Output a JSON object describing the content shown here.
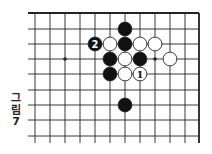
{
  "diagram": {
    "type": "go-board-partial",
    "caption": {
      "line1": "그",
      "line2": "림",
      "line3": "7"
    },
    "grid": {
      "columns_x": [
        35,
        50,
        65,
        80,
        95,
        110,
        125,
        140,
        155,
        170,
        185,
        199
      ],
      "rows_y": [
        13,
        29,
        44,
        59,
        74,
        90,
        105,
        120,
        136
      ],
      "left_open_x": 28,
      "bottom_open_y": 143,
      "edges": [
        "top",
        "right"
      ]
    },
    "star_points": [
      {
        "col": 2,
        "row": 3
      },
      {
        "col": 8,
        "row": 3
      }
    ],
    "stones": [
      {
        "col": 6,
        "row": 1,
        "color": "black",
        "label": ""
      },
      {
        "col": 4,
        "row": 2,
        "color": "black",
        "label": "2"
      },
      {
        "col": 5,
        "row": 2,
        "color": "white",
        "label": ""
      },
      {
        "col": 6,
        "row": 2,
        "color": "black",
        "label": ""
      },
      {
        "col": 7,
        "row": 2,
        "color": "white",
        "label": ""
      },
      {
        "col": 8,
        "row": 2,
        "color": "white",
        "label": ""
      },
      {
        "col": 5,
        "row": 3,
        "color": "black",
        "label": ""
      },
      {
        "col": 6,
        "row": 3,
        "color": "white",
        "label": ""
      },
      {
        "col": 7,
        "row": 3,
        "color": "black",
        "label": ""
      },
      {
        "col": 9,
        "row": 3,
        "color": "white",
        "label": ""
      },
      {
        "col": 5,
        "row": 4,
        "color": "black",
        "label": ""
      },
      {
        "col": 6,
        "row": 4,
        "color": "white",
        "label": ""
      },
      {
        "col": 7,
        "row": 4,
        "color": "white",
        "label": "1"
      },
      {
        "col": 6,
        "row": 6,
        "color": "black",
        "label": ""
      }
    ],
    "colors": {
      "line": "#222222",
      "black_stone": "#111111",
      "white_stone": "#ffffff",
      "background": "#ffffff"
    }
  }
}
